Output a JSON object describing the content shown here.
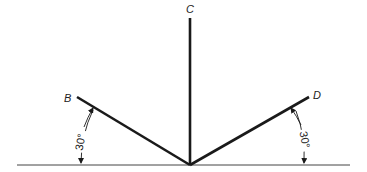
{
  "diagram": {
    "type": "geometry",
    "colors": {
      "stroke": "#1a1a1a",
      "baseline": "#444444",
      "background": "#ffffff"
    },
    "labels": {
      "b": "B",
      "c": "C",
      "d": "D"
    },
    "angles": {
      "left": "30°",
      "right": "30°"
    },
    "geometry": {
      "origin": [
        190,
        165
      ],
      "baseline": [
        [
          17,
          165
        ],
        [
          350,
          165
        ]
      ],
      "segment_b": [
        [
          190,
          165
        ],
        [
          77,
          97
        ]
      ],
      "segment_c": [
        [
          190,
          165
        ],
        [
          190,
          18
        ]
      ],
      "segment_d": [
        [
          190,
          165
        ],
        [
          309,
          97
        ]
      ]
    }
  }
}
